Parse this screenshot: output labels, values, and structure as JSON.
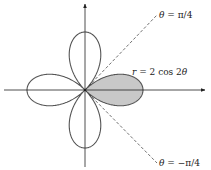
{
  "figure": {
    "curve_equation": "r = 2 cos 2θ",
    "curve_label": {
      "lhs": "r",
      "eq": " = 2 cos 2",
      "theta": "θ"
    },
    "upper_ray_label": {
      "theta": "θ",
      "rest": " = π/4"
    },
    "lower_ray_label": {
      "theta": "θ",
      "rest": " = −π/4"
    },
    "colors": {
      "curve": "#555555",
      "shaded_petal": "#c8c8c8",
      "axes": "#222222",
      "rays": "#333333"
    },
    "scale_px_per_unit": 29,
    "origin": {
      "x": 85,
      "y": 90
    }
  }
}
